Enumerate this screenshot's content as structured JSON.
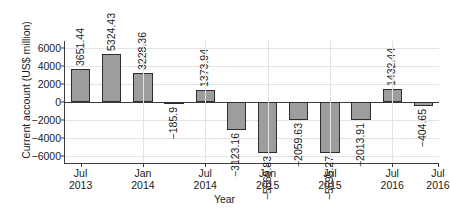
{
  "chart_data": {
    "type": "bar",
    "title": "",
    "xlabel": "Year",
    "ylabel": "Current account (US$ million)",
    "ylim": [
      -6800,
      6800
    ],
    "yticks": [
      6000,
      4000,
      2000,
      0,
      -2000,
      -4000,
      -6000
    ],
    "ytick_labels": [
      "6000",
      "4000",
      "2000",
      "0",
      "−2000",
      "−4000",
      "−6000"
    ],
    "grid": true,
    "legend": "none",
    "categories": [
      "Jul 2013",
      "Oct 2013",
      "Jan 2014",
      "Apr 2014",
      "Jul 2014",
      "Oct 2014",
      "Jan 2015",
      "Apr 2015",
      "Jul 2015",
      "Oct 2015",
      "Jan 2016",
      "Apr 2016"
    ],
    "values": [
      3651.44,
      5324.43,
      3228.36,
      -185.9,
      1373.94,
      -3123.16,
      -5669.83,
      -2059.63,
      -5695.27,
      -2013.91,
      1432.44,
      -404.65
    ],
    "data_labels": [
      "3651.44",
      "5324.43",
      "3228.36",
      "−185.9",
      "1373.94",
      "−3123.16",
      "−5669.83",
      "−2059.63",
      "−5695.27",
      "−2013.91",
      "1432.44",
      "−404.65"
    ],
    "xtick_labels": [
      {
        "line1": "Jul",
        "line2": "2013"
      },
      {
        "line1": "Jan",
        "line2": "2014"
      },
      {
        "line1": "Jul",
        "line2": "2014"
      },
      {
        "line1": "Jan",
        "line2": "2015"
      },
      {
        "line1": "Jul",
        "line2": "2015"
      },
      {
        "line1": "Jul",
        "line2": "2016"
      },
      {
        "line1": "Jul",
        "line2": "2016"
      }
    ],
    "bar_color": "#9d9d9d",
    "bar_edge_color": "#2e2e2e",
    "axis_color": "#3c3c3c",
    "grid_color": "#e3e3e3"
  }
}
